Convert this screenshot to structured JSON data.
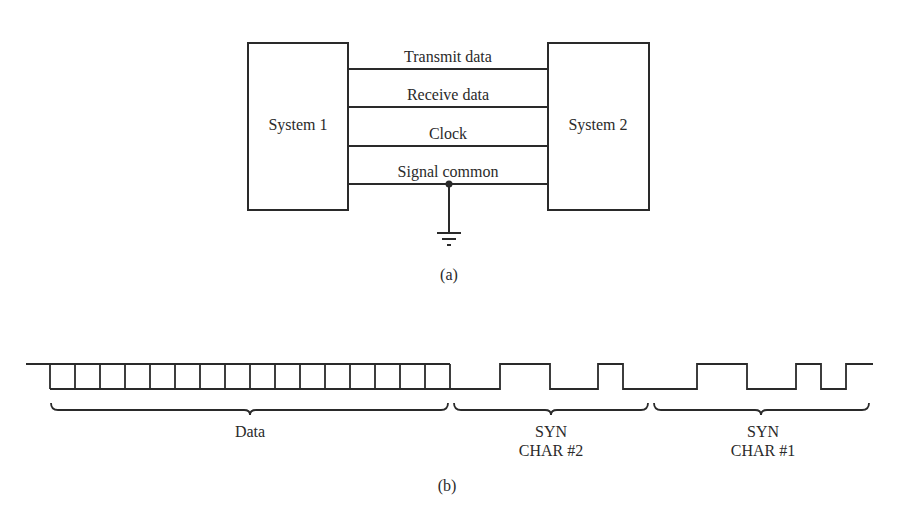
{
  "figure_a": {
    "caption": "(a)",
    "system_left": {
      "label": "System 1"
    },
    "system_right": {
      "label": "System 2"
    },
    "lines": [
      {
        "label": "Transmit data"
      },
      {
        "label": "Receive data"
      },
      {
        "label": "Clock"
      },
      {
        "label": "Signal common"
      }
    ],
    "ground_symbol": "ground-icon"
  },
  "figure_b": {
    "caption": "(b)",
    "data_bits_count": 16,
    "segments": [
      {
        "label": "Data",
        "sublabel": ""
      },
      {
        "label": "SYN",
        "sublabel": "CHAR #2"
      },
      {
        "label": "SYN",
        "sublabel": "CHAR #1"
      }
    ]
  },
  "colors": {
    "ink": "#2a2a2a",
    "background": "#ffffff"
  }
}
